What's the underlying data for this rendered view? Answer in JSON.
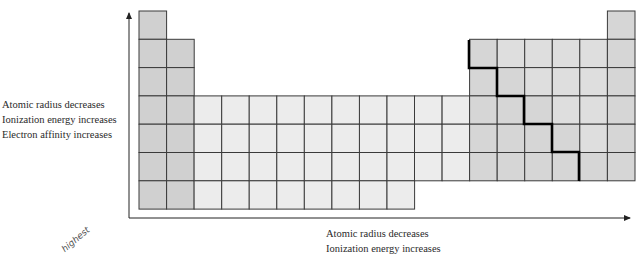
{
  "diagram": {
    "colors": {
      "s_block": "#d0d0d0",
      "d_block": "#ececec",
      "p_block": "#d6d6d6",
      "p_block_light": "#dedede",
      "grid_line": "#3a3a3a",
      "staircase": "#000000",
      "axis": "#222222"
    },
    "layout": {
      "left": 139,
      "top": 11,
      "cell_w": 27.55,
      "cell_h": 28.3,
      "columns": 18,
      "rows": 7
    },
    "column_heights": [
      {
        "col": 1,
        "rows": [
          1,
          2,
          3,
          4,
          5,
          6,
          7
        ],
        "block": "s"
      },
      {
        "col": 2,
        "rows": [
          2,
          3,
          4,
          5,
          6,
          7
        ],
        "block": "s"
      },
      {
        "col": 3,
        "rows": [
          4,
          5,
          6,
          7
        ],
        "block": "d"
      },
      {
        "col": 4,
        "rows": [
          4,
          5,
          6,
          7
        ],
        "block": "d"
      },
      {
        "col": 5,
        "rows": [
          4,
          5,
          6,
          7
        ],
        "block": "d"
      },
      {
        "col": 6,
        "rows": [
          4,
          5,
          6,
          7
        ],
        "block": "d"
      },
      {
        "col": 7,
        "rows": [
          4,
          5,
          6,
          7
        ],
        "block": "d"
      },
      {
        "col": 8,
        "rows": [
          4,
          5,
          6,
          7
        ],
        "block": "d"
      },
      {
        "col": 9,
        "rows": [
          4,
          5,
          6,
          7
        ],
        "block": "d"
      },
      {
        "col": 10,
        "rows": [
          4,
          5,
          6,
          7
        ],
        "block": "d"
      },
      {
        "col": 11,
        "rows": [
          4,
          5,
          6
        ],
        "block": "d"
      },
      {
        "col": 12,
        "rows": [
          4,
          5,
          6
        ],
        "block": "d"
      },
      {
        "col": 13,
        "rows": [
          2,
          3,
          4,
          5,
          6
        ],
        "block": "p"
      },
      {
        "col": 14,
        "rows": [
          2,
          3,
          4,
          5,
          6
        ],
        "block": "p"
      },
      {
        "col": 15,
        "rows": [
          2,
          3,
          4,
          5,
          6
        ],
        "block": "p"
      },
      {
        "col": 16,
        "rows": [
          2,
          3,
          4,
          5,
          6
        ],
        "block": "p"
      },
      {
        "col": 17,
        "rows": [
          2,
          3,
          4,
          5,
          6
        ],
        "block": "p"
      },
      {
        "col": 18,
        "rows": [
          1,
          2,
          3,
          4,
          5,
          6
        ],
        "block": "p"
      }
    ],
    "staircase_points": [
      [
        469,
        40
      ],
      [
        469,
        68
      ],
      [
        497,
        68
      ],
      [
        497,
        96
      ],
      [
        524,
        96
      ],
      [
        524,
        124
      ],
      [
        552,
        124
      ],
      [
        552,
        152
      ],
      [
        579,
        152
      ],
      [
        579,
        181
      ]
    ],
    "vertical_axis": {
      "direction": "up",
      "labels": [
        "Atomic radius decreases",
        "Ionization energy increases",
        "Electron affinity increases"
      ]
    },
    "horizontal_axis": {
      "direction": "right",
      "labels": [
        "Atomic radius decreases",
        "Ionization energy increases"
      ]
    },
    "annotation": {
      "handwriting": "highest"
    }
  }
}
